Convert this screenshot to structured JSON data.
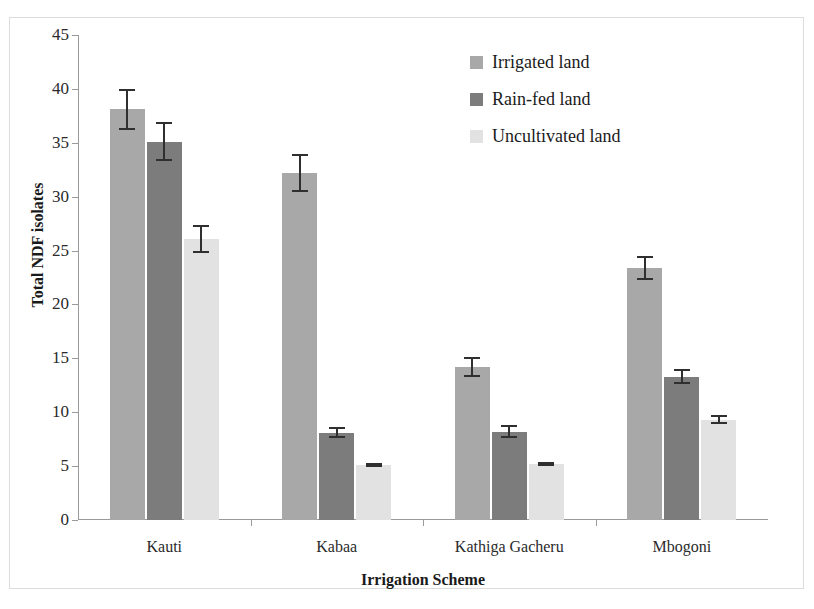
{
  "chart_data": {
    "type": "bar",
    "title": "",
    "xlabel": "Irrigation Scheme",
    "ylabel": "Total NDF isolates",
    "categories": [
      "Kauti",
      "Kabaa",
      "Kathiga Gacheru",
      "Mbogoni"
    ],
    "ylim": [
      0,
      45
    ],
    "ytick_step": 5,
    "yticks": [
      0,
      5,
      10,
      15,
      20,
      25,
      30,
      35,
      40,
      45
    ],
    "ytick_labels": [
      "0",
      "5",
      "10",
      "15",
      "20",
      "25",
      "30",
      "35",
      "40",
      "45"
    ],
    "grid": false,
    "legend_position": "top-right",
    "error_bars": "symmetric",
    "series": [
      {
        "name": "Irrigated land",
        "color": "#a8a8a8",
        "values": [
          38.1,
          32.2,
          14.2,
          23.4
        ],
        "errors": [
          1.9,
          1.8,
          0.9,
          1.1
        ]
      },
      {
        "name": "Rain-fed land",
        "color": "#7c7c7c",
        "values": [
          35.1,
          8.1,
          8.2,
          13.3
        ],
        "errors": [
          1.8,
          0.5,
          0.6,
          0.7
        ]
      },
      {
        "name": "Uncultivated land",
        "color": "#e2e2e2",
        "values": [
          26.1,
          5.1,
          5.2,
          9.3
        ],
        "errors": [
          1.3,
          0.2,
          0.2,
          0.4
        ]
      }
    ]
  },
  "axis_line_color": "#9a9a9a",
  "error_bar_color": "#2f2f2f"
}
